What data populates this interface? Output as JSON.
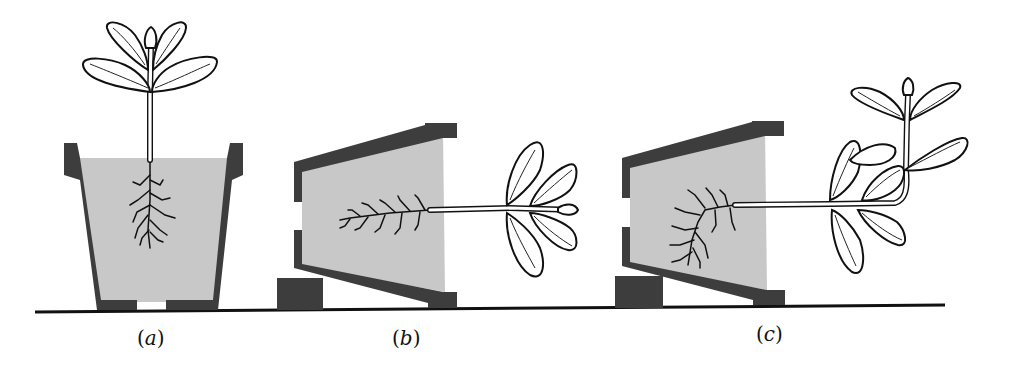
{
  "figure": {
    "panels": [
      {
        "id": "a",
        "label": "(a)",
        "letter": "a",
        "description": "Upright pot, stem grows upward, roots grow downward"
      },
      {
        "id": "b",
        "label": "(b)",
        "letter": "b",
        "description": "Pot tipped on its side, stem horizontal"
      },
      {
        "id": "c",
        "label": "(c)",
        "letter": "c",
        "description": "Pot on its side after time; stem tip curves upward, roots curve downward"
      }
    ],
    "colors": {
      "pot": "#3d3d3d",
      "soil": "#c8c8c8",
      "line": "#111111",
      "background": "#ffffff"
    }
  }
}
